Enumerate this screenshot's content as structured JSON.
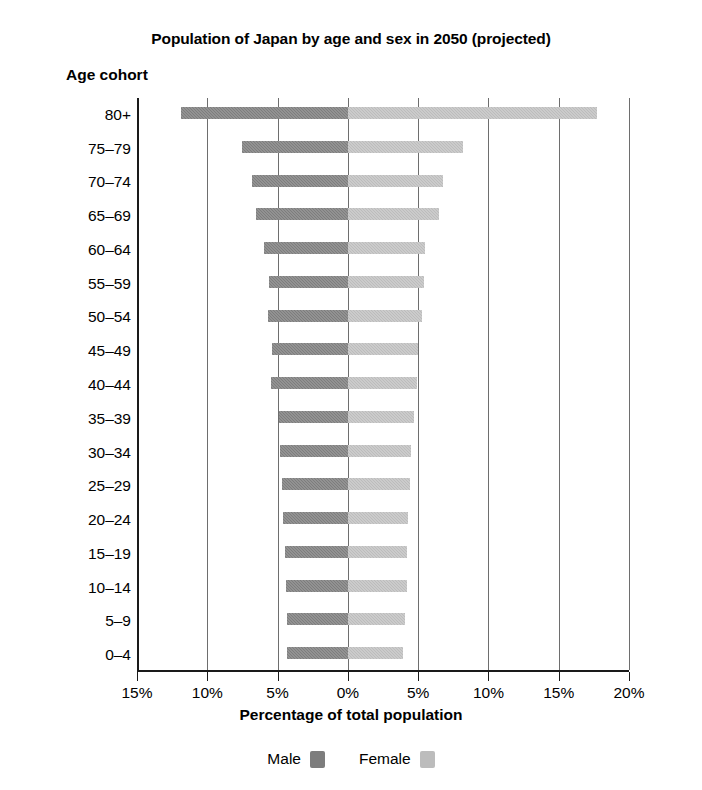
{
  "chart_data": {
    "type": "bar",
    "subtype": "population-pyramid",
    "title": "Population of Japan by age and sex in 2050 (projected)",
    "xlabel": "Percentage of total population",
    "ylabel": "Age cohort",
    "xtick_labels": [
      "15%",
      "10%",
      "5%",
      "0%",
      "5%",
      "10%",
      "15%",
      "20%"
    ],
    "xtick_values": [
      -15,
      -10,
      -5,
      0,
      5,
      10,
      15,
      20
    ],
    "xlim": [
      -15,
      20
    ],
    "grid": "vertical",
    "legend_position": "bottom",
    "categories": [
      "80+",
      "75–79",
      "70–74",
      "65–69",
      "60–64",
      "55–59",
      "50–54",
      "45–49",
      "40–44",
      "35–39",
      "30–34",
      "25–29",
      "20–24",
      "15–19",
      "10–14",
      "5–9",
      "0–4"
    ],
    "series": [
      {
        "name": "Male",
        "color": "#7d7d7d",
        "side": "left",
        "values": [
          11.9,
          7.5,
          6.8,
          6.5,
          6.0,
          5.6,
          5.7,
          5.4,
          5.5,
          4.9,
          4.8,
          4.7,
          4.6,
          4.5,
          4.4,
          4.3,
          4.3
        ]
      },
      {
        "name": "Female",
        "color": "#bcbcbc",
        "side": "right",
        "values": [
          17.7,
          8.2,
          6.8,
          6.5,
          5.5,
          5.4,
          5.3,
          5.0,
          4.9,
          4.7,
          4.5,
          4.4,
          4.3,
          4.2,
          4.2,
          4.1,
          3.9
        ]
      }
    ]
  },
  "legend": {
    "items": [
      {
        "label": "Male",
        "color": "#7d7d7d"
      },
      {
        "label": "Female",
        "color": "#bcbcbc"
      }
    ]
  }
}
